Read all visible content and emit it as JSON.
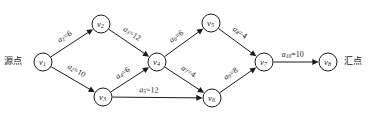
{
  "figure": {
    "type": "directed-network-graph",
    "width": 368,
    "height": 127,
    "background": "#ffffff",
    "stroke_color": "#1a1a1a"
  },
  "endpoints": {
    "source_label": "源点",
    "sink_label": "汇点"
  },
  "nodes": [
    {
      "id": "v1",
      "base": "v",
      "sub": "1",
      "x": 43,
      "y": 62,
      "r": 9
    },
    {
      "id": "v2",
      "base": "v",
      "sub": "2",
      "x": 101,
      "y": 24,
      "r": 9
    },
    {
      "id": "v3",
      "base": "v",
      "sub": "3",
      "x": 103,
      "y": 97,
      "r": 9
    },
    {
      "id": "v4",
      "base": "v",
      "sub": "4",
      "x": 157,
      "y": 62,
      "r": 9
    },
    {
      "id": "v5",
      "base": "v",
      "sub": "5",
      "x": 211,
      "y": 23,
      "r": 9
    },
    {
      "id": "v6",
      "base": "v",
      "sub": "6",
      "x": 212,
      "y": 98,
      "r": 9
    },
    {
      "id": "v7",
      "base": "v",
      "sub": "7",
      "x": 264,
      "y": 62,
      "r": 9
    },
    {
      "id": "v8",
      "base": "v",
      "sub": "8",
      "x": 328,
      "y": 62,
      "r": 9
    }
  ],
  "edges": [
    {
      "id": "a1",
      "base": "a",
      "sub": "1",
      "value": "6",
      "label": "a₁=6",
      "from": "v1",
      "to": "v2",
      "label_offset": -9,
      "label_t": 0.46
    },
    {
      "id": "a2",
      "base": "a",
      "sub": "2",
      "value": "10",
      "label": "a₂=10",
      "from": "v1",
      "to": "v3",
      "label_offset": -9,
      "label_t": 0.48
    },
    {
      "id": "a3",
      "base": "a",
      "sub": "3",
      "value": "12",
      "label": "a₃=12",
      "from": "v2",
      "to": "v4",
      "label_offset": -9,
      "label_t": 0.46
    },
    {
      "id": "a4",
      "base": "a",
      "sub": "4",
      "value": "6",
      "label": "a₄=6",
      "from": "v3",
      "to": "v4",
      "label_offset": -9,
      "label_t": 0.46
    },
    {
      "id": "a5",
      "base": "a",
      "sub": "5",
      "value": "12",
      "label": "a₅=12",
      "from": "v3",
      "to": "v6",
      "label_offset": -7,
      "label_t": 0.42
    },
    {
      "id": "a6",
      "base": "a",
      "sub": "6",
      "value": "6",
      "label": "a₆=6",
      "from": "v4",
      "to": "v5",
      "label_offset": -9,
      "label_t": 0.46
    },
    {
      "id": "a7",
      "base": "a",
      "sub": "7",
      "value": "4",
      "label": "a₇=4",
      "from": "v4",
      "to": "v6",
      "label_offset": -9,
      "label_t": 0.48
    },
    {
      "id": "a8",
      "base": "a",
      "sub": "8",
      "value": "4",
      "label": "a₈=4",
      "from": "v5",
      "to": "v7",
      "label_offset": -9,
      "label_t": 0.44
    },
    {
      "id": "a9",
      "base": "a",
      "sub": "9",
      "value": "8",
      "label": "a₉=8",
      "from": "v6",
      "to": "v7",
      "label_offset": -9,
      "label_t": 0.46
    },
    {
      "id": "a10",
      "base": "a",
      "sub": "10",
      "value": "10",
      "label": "a₁₀=10",
      "from": "v7",
      "to": "v8",
      "label_offset": -7,
      "label_t": 0.45
    }
  ]
}
